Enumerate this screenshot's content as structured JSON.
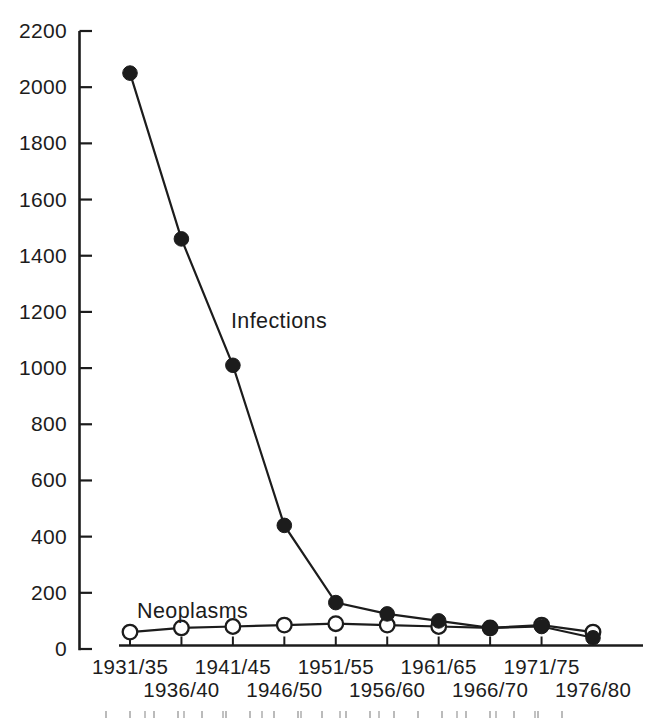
{
  "figure": {
    "background_color": "#ffffff",
    "ink_color": "#1c1c1c"
  },
  "chart_data": {
    "type": "line",
    "title": "",
    "xlabel": "",
    "ylabel": "",
    "categories": [
      "1931/35",
      "1936/40",
      "1941/45",
      "1946/50",
      "1951/55",
      "1956/60",
      "1961/65",
      "1966/70",
      "1971/75",
      "1976/80"
    ],
    "series": [
      {
        "name": "Infections",
        "marker": "filled-circle",
        "color": "#1c1c1c",
        "values": [
          2050,
          1460,
          1010,
          440,
          165,
          125,
          100,
          75,
          80,
          40
        ]
      },
      {
        "name": "Neoplasms",
        "marker": "open-circle",
        "color": "#1c1c1c",
        "values": [
          60,
          75,
          80,
          85,
          90,
          85,
          80,
          75,
          85,
          60
        ]
      }
    ],
    "ylim": [
      0,
      2200
    ],
    "yticks": [
      0,
      200,
      400,
      600,
      800,
      1000,
      1200,
      1400,
      1600,
      1800,
      2000,
      2200
    ],
    "grid": false,
    "legend_position": "inline-annotations",
    "x_label_layout": "staggered-two-rows",
    "annotations": [
      {
        "text": "Infections"
      },
      {
        "text": "Neoplasms"
      }
    ]
  }
}
